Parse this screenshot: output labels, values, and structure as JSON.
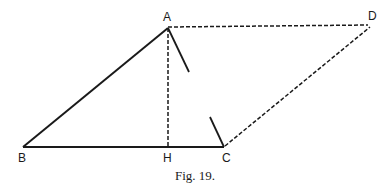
{
  "figure": {
    "caption": "Fig. 19.",
    "points": {
      "A": {
        "label": "A",
        "x": 168,
        "y": 27
      },
      "B": {
        "label": "B",
        "x": 23,
        "y": 147
      },
      "H": {
        "label": "H",
        "x": 168,
        "y": 147
      },
      "C": {
        "label": "C",
        "x": 224,
        "y": 147
      },
      "D": {
        "label": "D",
        "x": 370,
        "y": 25
      }
    },
    "segments": [
      {
        "from": "A",
        "to": "B",
        "style": "solid"
      },
      {
        "from": "B",
        "to": "C",
        "style": "solid"
      },
      {
        "from": "A",
        "to": "H",
        "style": "dashed"
      },
      {
        "from": "A",
        "to": "D",
        "style": "dashed"
      },
      {
        "from": "C",
        "to": "D",
        "style": "dashed"
      },
      {
        "from": "A",
        "to": "C",
        "style": "partial-solid"
      }
    ],
    "colors": {
      "ink": "#1a1a1a",
      "background": "#ffffff"
    }
  }
}
